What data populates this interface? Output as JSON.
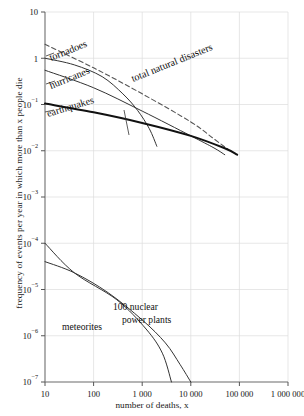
{
  "chart_data": {
    "type": "line",
    "title": "",
    "xlabel": "number of deaths, x",
    "ylabel": "frequency of events per year in which more than x people die",
    "xscale": "log",
    "yscale": "log",
    "xlim": [
      10,
      1000000
    ],
    "ylim": [
      1e-07,
      10
    ],
    "grid": true,
    "legend_position": "inline-annotations",
    "xticks": [
      {
        "value": 10,
        "label": "10"
      },
      {
        "value": 100,
        "label": "100"
      },
      {
        "value": 1000,
        "label": "1 000"
      },
      {
        "value": 10000,
        "label": "10 000"
      },
      {
        "value": 100000,
        "label": "100 000"
      },
      {
        "value": 1000000,
        "label": "1 000 000"
      }
    ],
    "yticks": [
      {
        "value": 10,
        "label": "10",
        "mantissa": "10",
        "exponent": ""
      },
      {
        "value": 1,
        "label": "1",
        "mantissa": "1",
        "exponent": ""
      },
      {
        "value": 0.1,
        "label": "10-1",
        "mantissa": "10",
        "exponent": "−1"
      },
      {
        "value": 0.01,
        "label": "10-2",
        "mantissa": "10",
        "exponent": "−2"
      },
      {
        "value": 0.001,
        "label": "10-3",
        "mantissa": "10",
        "exponent": "−3"
      },
      {
        "value": 0.0001,
        "label": "10-4",
        "mantissa": "10",
        "exponent": "−4"
      },
      {
        "value": 1e-05,
        "label": "10-5",
        "mantissa": "10",
        "exponent": "−5"
      },
      {
        "value": 1e-06,
        "label": "10-6",
        "mantissa": "10",
        "exponent": "−6"
      },
      {
        "value": 1e-07,
        "label": "10-7",
        "mantissa": "10",
        "exponent": "−7"
      }
    ],
    "series": [
      {
        "name": "total natural disasters",
        "label": "total natural disasters",
        "style": "dashed",
        "color": "#555555",
        "points": [
          [
            10,
            2.0
          ],
          [
            100,
            0.62
          ],
          [
            1000,
            0.17
          ],
          [
            10000,
            0.042
          ],
          [
            30000,
            0.018
          ],
          [
            60000,
            0.0105
          ]
        ]
      },
      {
        "name": "tornadoes",
        "label": "tornadoes",
        "style": "solid",
        "color": "#333333",
        "points": [
          [
            10,
            1.0
          ],
          [
            40,
            0.72
          ],
          [
            150,
            0.4
          ],
          [
            400,
            0.17
          ],
          [
            800,
            0.075
          ],
          [
            1400,
            0.03
          ],
          [
            2000,
            0.0125
          ]
        ]
      },
      {
        "name": "hurricanes",
        "label": "hurricanes",
        "style": "solid",
        "color": "#333333",
        "points": [
          [
            10,
            0.55
          ],
          [
            100,
            0.23
          ],
          [
            1000,
            0.072
          ],
          [
            10000,
            0.021
          ],
          [
            30000,
            0.0115
          ],
          [
            50000,
            0.0082
          ]
        ]
      },
      {
        "name": "earthquakes",
        "label": "earthquakes",
        "style": "solid-thick",
        "color": "#111111",
        "points": [
          [
            10,
            0.105
          ],
          [
            100,
            0.068
          ],
          [
            1000,
            0.04
          ],
          [
            10000,
            0.021
          ],
          [
            50000,
            0.0113
          ],
          [
            90000,
            0.0082
          ]
        ]
      },
      {
        "name": "meteorites",
        "label": "meteorites",
        "style": "solid",
        "color": "#333333",
        "points": [
          [
            10,
            0.0001
          ],
          [
            40,
            2.3e-05
          ],
          [
            300,
            6e-06
          ],
          [
            1200,
            1.4e-06
          ],
          [
            2600,
            4.2e-07
          ],
          [
            4000,
            1e-07
          ]
        ]
      },
      {
        "name": "100 nuclear power plants",
        "label": "100 nuclear power plants",
        "label_line1": "100 nuclear",
        "label_line2": "power plants",
        "style": "solid",
        "color": "#333333",
        "points": [
          [
            10,
            4e-05
          ],
          [
            40,
            2.3e-05
          ],
          [
            200,
            8.5e-06
          ],
          [
            1000,
            2.2e-06
          ],
          [
            3000,
            7e-07
          ],
          [
            6000,
            2.4e-07
          ],
          [
            10000,
            1e-07
          ]
        ]
      }
    ]
  }
}
